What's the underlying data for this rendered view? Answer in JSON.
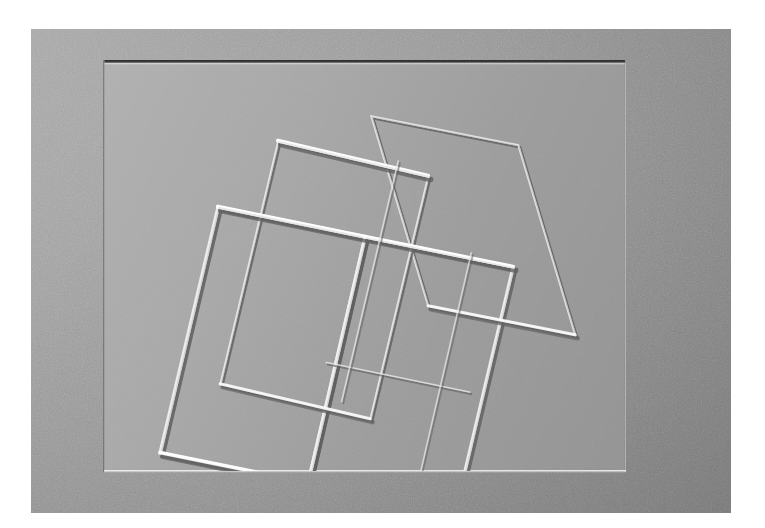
{
  "artwork": {
    "title": "Embossed Geometric Relief",
    "medium": "blind-embossed paper",
    "surface_label": "textured gray paper card",
    "panel_label": "recessed inner panel",
    "alt_text": "Three overlapping rotated squares blind-embossed into gray textured paper inside a rectangular recessed panel",
    "background_color": "#8d8d8d",
    "panel_color": "#9e9e9e",
    "mat_color": "#ffffff",
    "highlight_color": "#e8e8e8",
    "shadow_color": "#5e5e5e",
    "card": {
      "x": 31,
      "y": 29,
      "width": 700,
      "height": 484
    },
    "panel": {
      "x": 104,
      "y": 63,
      "width": 520,
      "height": 408
    }
  },
  "chart_data": {
    "type": "line",
    "xlabel": "",
    "ylabel": "",
    "xlim": [
      0,
      520
    ],
    "ylim": [
      0,
      408
    ],
    "grid": false,
    "legend": "none",
    "annotations": [
      "blind emboss, raised ridge lines",
      "light source upper-left"
    ],
    "series": [
      {
        "name": "square-a-outer",
        "closed": true,
        "weight": "heavy",
        "x": [
          268,
          415,
          472,
          325
        ],
        "y": [
          54,
          83,
          273,
          244
        ]
      },
      {
        "name": "square-b-outer",
        "closed": true,
        "weight": "heavy",
        "x": [
          175,
          325,
          267,
          117
        ],
        "y": [
          79,
          114,
          357,
          322
        ]
      },
      {
        "name": "square-c-outer",
        "closed": true,
        "weight": "heavy",
        "x": [
          115,
          262,
          205,
          57
        ],
        "y": [
          145,
          175,
          421,
          391
        ]
      },
      {
        "name": "square-d-outer",
        "closed": true,
        "weight": "heavy",
        "x": [
          262,
          410,
          352,
          205
        ],
        "y": [
          175,
          205,
          451,
          421
        ]
      },
      {
        "name": "inner-cross-1",
        "closed": false,
        "weight": "light",
        "x": [
          222,
          367
        ],
        "y": [
          300,
          330
        ]
      },
      {
        "name": "inner-cross-2",
        "closed": false,
        "weight": "light",
        "x": [
          295,
          238
        ],
        "y": [
          98,
          340
        ]
      }
    ]
  }
}
